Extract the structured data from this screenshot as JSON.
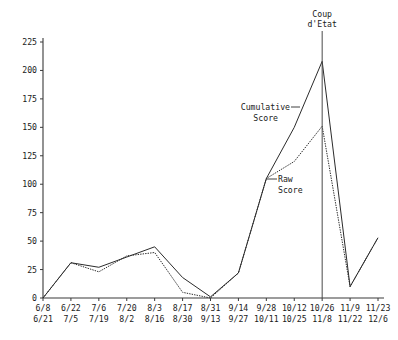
{
  "chart_data": {
    "type": "line",
    "title": "",
    "xlabel": "",
    "ylabel": "",
    "ylim": [
      0,
      225
    ],
    "ytick_values": [
      0,
      25,
      50,
      75,
      100,
      125,
      150,
      175,
      200,
      225
    ],
    "ytick_labels": [
      "0",
      "25",
      "50",
      "75",
      "100",
      "125",
      "150",
      "175",
      "200",
      "225"
    ],
    "grid": false,
    "legend_position": "inline-annotations",
    "categories": [
      "6/8\n6/21",
      "6/22\n7/5",
      "7/6\n7/19",
      "7/20\n8/2",
      "8/3\n8/16",
      "8/17\n8/30",
      "8/31\n9/13",
      "9/14\n9/27",
      "9/28\n10/11",
      "10/12\n10/25",
      "10/26\n11/8",
      "11/9\n11/22",
      "11/23\n12/6"
    ],
    "xtick_top": [
      "6/8",
      "6/22",
      "7/6",
      "7/20",
      "8/3",
      "8/17",
      "8/31",
      "9/14",
      "9/28",
      "10/12",
      "10/26",
      "11/9",
      "11/23"
    ],
    "xtick_bottom": [
      "6/21",
      "7/5",
      "7/19",
      "8/2",
      "8/16",
      "8/30",
      "9/13",
      "9/27",
      "10/11",
      "10/25",
      "11/8",
      "11/22",
      "12/6"
    ],
    "series": [
      {
        "name": "Cumulative Score",
        "style": "solid",
        "values": [
          0,
          31,
          27,
          36,
          45,
          18,
          1,
          22,
          105,
          150,
          208,
          10,
          53
        ]
      },
      {
        "name": "Raw Score",
        "style": "dashed",
        "values": [
          0,
          31,
          23,
          37,
          40,
          5,
          0,
          22,
          105,
          120,
          151,
          10,
          53
        ]
      }
    ],
    "annotations": [
      {
        "name": "coup-event",
        "text_line1": "Coup",
        "text_line2": "d'Etat",
        "at_category": "10/26\n11/8",
        "kind": "vertical-event-line"
      },
      {
        "name": "cumulative-label",
        "text_line1": "Cumulative",
        "text_line2": "Score",
        "kind": "leader-label"
      },
      {
        "name": "raw-label",
        "text_line1": "Raw",
        "text_line2": "Score",
        "kind": "leader-label"
      }
    ]
  },
  "colors": {
    "axis": "#3a3a3a",
    "series": "#2b2b2b",
    "event": "#4a4a4a",
    "background": "#ffffff"
  }
}
